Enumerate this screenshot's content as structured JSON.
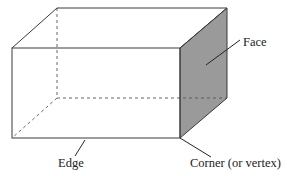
{
  "diagram": {
    "labels": {
      "face": "Face",
      "edge": "Edge",
      "corner": "Corner (or vertex)"
    },
    "colors": {
      "line": "#3a3a3a",
      "face_fill": "#9a9a9a",
      "background": "#ffffff"
    }
  }
}
